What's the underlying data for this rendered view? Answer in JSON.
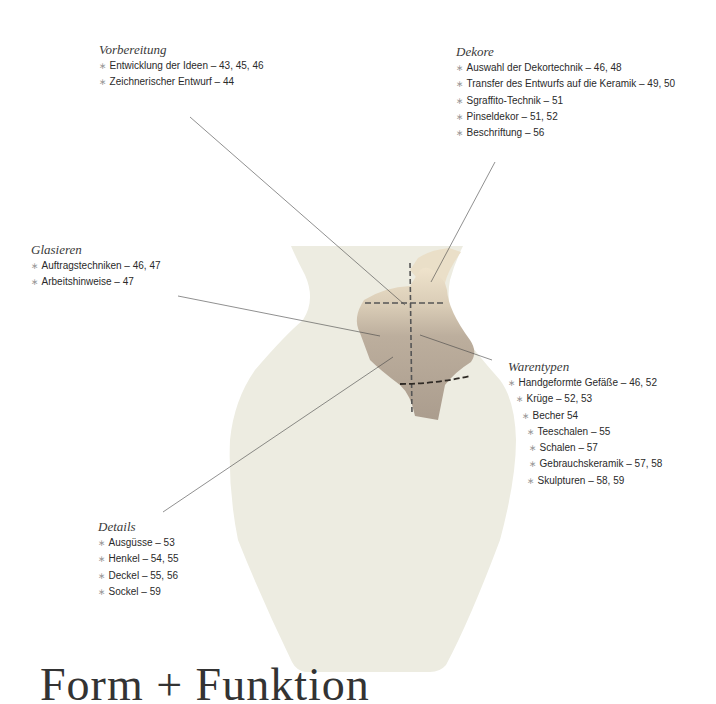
{
  "page": {
    "headline": "Form + Funktion"
  },
  "sections": {
    "vorbereitung": {
      "title": "Vorbereitung",
      "items": [
        {
          "label": "Entwicklung der Ideen – 43, 45, 46"
        },
        {
          "label": "Zeichnerischer Entwurf – 44"
        }
      ]
    },
    "dekore": {
      "title": "Dekore",
      "items": [
        {
          "label": "Auswahl der Dekortechnik – 46, 48"
        },
        {
          "label": "Transfer des Entwurfs auf die Keramik – 49, 50"
        },
        {
          "label": "Sgraffito-Technik – 51"
        },
        {
          "label": "Pinseldekor – 51, 52"
        },
        {
          "label": "Beschriftung – 56"
        }
      ]
    },
    "glasieren": {
      "title": "Glasieren",
      "items": [
        {
          "label": "Auftragstechniken – 46, 47"
        },
        {
          "label": "Arbeitshinweise – 47"
        }
      ]
    },
    "warentypen": {
      "title": "Warentypen",
      "items": [
        {
          "label": "Handgeformte Gefäße – 46, 52"
        },
        {
          "label": "Krüge – 52, 53"
        },
        {
          "label": "Becher 54"
        },
        {
          "label": "Teeschalen – 55"
        },
        {
          "label": "Schalen – 57"
        },
        {
          "label": "Gebrauchskeramik – 57, 58"
        },
        {
          "label": "Skulpturen – 58, 59"
        }
      ]
    },
    "details": {
      "title": "Details",
      "items": [
        {
          "label": "Ausgüsse – 53"
        },
        {
          "label": "Henkel – 54, 55"
        },
        {
          "label": "Deckel – 55, 56"
        },
        {
          "label": "Sockel – 59"
        }
      ]
    }
  },
  "bullet_glyph": "∗",
  "colors": {
    "vase": "#edece1",
    "shard_light": "#e6d9c1",
    "shard_dark": "#b3a595",
    "leader_line": "#444444"
  }
}
